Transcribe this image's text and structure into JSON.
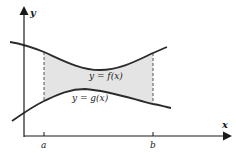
{
  "diagram": {
    "type": "area-between-curves",
    "axes": {
      "x_label": "x",
      "y_label": "y"
    },
    "curves": {
      "upper": {
        "label": "y = f(x)",
        "name": "f"
      },
      "lower": {
        "label": "y = g(x)",
        "name": "g"
      }
    },
    "bounds": {
      "left": "a",
      "right": "b"
    },
    "colors": {
      "curve": "#2b2b2b",
      "fill": "#e4e4e4",
      "axis": "#1a1a1a",
      "dash": "#555555"
    }
  }
}
